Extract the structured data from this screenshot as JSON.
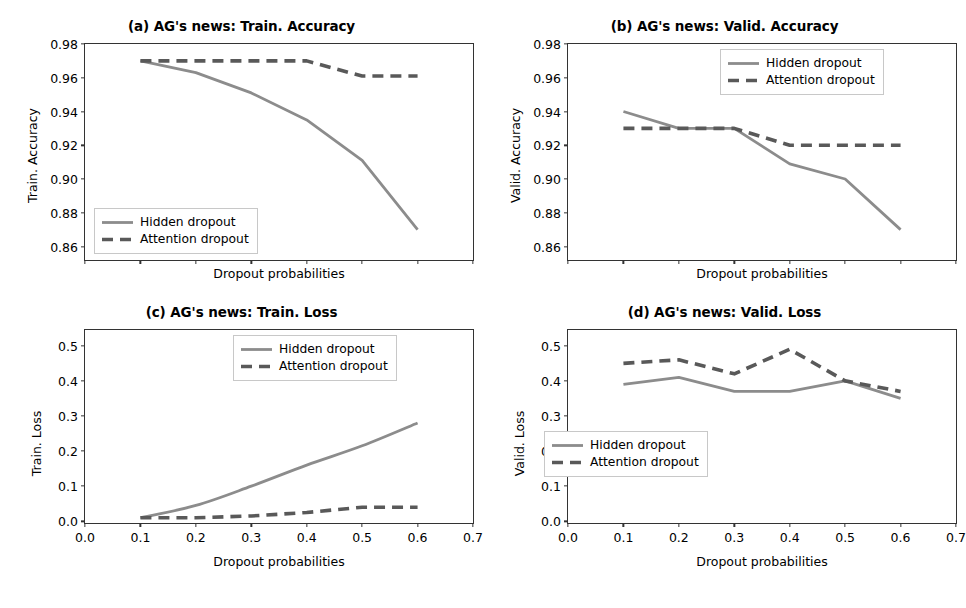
{
  "figure": {
    "width": 966,
    "height": 608,
    "background": "#ffffff",
    "series_colors": {
      "hidden": "#8c8c8c",
      "attention": "#595959"
    },
    "axis_color": "#333333"
  },
  "common": {
    "xlabel": "Dropout probabilities",
    "legend": {
      "hidden_label": "Hidden dropout",
      "attention_label": "Attention dropout"
    },
    "x_values": [
      0.1,
      0.2,
      0.3,
      0.4,
      0.5,
      0.6
    ],
    "x_tick_labels": [
      "0.0",
      "0.1",
      "0.2",
      "0.3",
      "0.4",
      "0.5",
      "0.6",
      "0.7"
    ]
  },
  "panels": {
    "a": {
      "title": "(a) AG's news: Train. Accuracy",
      "ylabel": "Train. Accuracy",
      "y_tick_labels": [
        "0.86",
        "0.88",
        "0.90",
        "0.92",
        "0.94",
        "0.96",
        "0.98"
      ]
    },
    "b": {
      "title": "(b) AG's news: Valid. Accuracy",
      "ylabel": "Valid. Accuracy",
      "y_tick_labels": [
        "0.86",
        "0.88",
        "0.90",
        "0.92",
        "0.94",
        "0.96",
        "0.98"
      ]
    },
    "c": {
      "title": "(c) AG's news: Train. Loss",
      "ylabel": "Train. Loss",
      "y_tick_labels": [
        "0.0",
        "0.1",
        "0.2",
        "0.3",
        "0.4",
        "0.5"
      ]
    },
    "d": {
      "title": "(d) AG's news: Valid. Loss",
      "ylabel": "Valid. Loss",
      "y_tick_labels": [
        "0.0",
        "0.1",
        "0.2",
        "0.3",
        "0.4",
        "0.5"
      ]
    }
  },
  "chart_data": [
    {
      "id": "a",
      "type": "line",
      "title": "(a) AG's news: Train. Accuracy",
      "xlabel": "Dropout probabilities",
      "ylabel": "Train. Accuracy",
      "x": [
        0.1,
        0.2,
        0.3,
        0.4,
        0.5,
        0.6
      ],
      "xlim": [
        0.0,
        0.7
      ],
      "ylim": [
        0.852,
        0.98
      ],
      "yticks": [
        0.86,
        0.88,
        0.9,
        0.92,
        0.94,
        0.96,
        0.98
      ],
      "xticks": [
        0.0,
        0.1,
        0.2,
        0.3,
        0.4,
        0.5,
        0.6,
        0.7
      ],
      "xticklabels_visible": false,
      "grid": false,
      "legend_position": "lower left",
      "series": [
        {
          "name": "Hidden dropout",
          "style": "solid",
          "color": "#8c8c8c",
          "values": [
            0.97,
            0.963,
            0.951,
            0.935,
            0.911,
            0.87
          ]
        },
        {
          "name": "Attention dropout",
          "style": "dashed",
          "color": "#595959",
          "values": [
            0.97,
            0.97,
            0.97,
            0.97,
            0.961,
            0.961
          ]
        }
      ]
    },
    {
      "id": "b",
      "type": "line",
      "title": "(b) AG's news: Valid. Accuracy",
      "xlabel": "Dropout probabilities",
      "ylabel": "Valid. Accuracy",
      "x": [
        0.1,
        0.2,
        0.3,
        0.4,
        0.5,
        0.6
      ],
      "xlim": [
        0.0,
        0.7
      ],
      "ylim": [
        0.852,
        0.98
      ],
      "yticks": [
        0.86,
        0.88,
        0.9,
        0.92,
        0.94,
        0.96,
        0.98
      ],
      "xticks": [
        0.0,
        0.1,
        0.2,
        0.3,
        0.4,
        0.5,
        0.6,
        0.7
      ],
      "xticklabels_visible": false,
      "grid": false,
      "legend_position": "upper right",
      "series": [
        {
          "name": "Hidden dropout",
          "style": "solid",
          "color": "#8c8c8c",
          "values": [
            0.94,
            0.93,
            0.93,
            0.909,
            0.9,
            0.87
          ]
        },
        {
          "name": "Attention dropout",
          "style": "dashed",
          "color": "#595959",
          "values": [
            0.93,
            0.93,
            0.93,
            0.92,
            0.92,
            0.92
          ]
        }
      ]
    },
    {
      "id": "c",
      "type": "line",
      "title": "(c) AG's news: Train. Loss",
      "xlabel": "Dropout probabilities",
      "ylabel": "Train. Loss",
      "x": [
        0.1,
        0.2,
        0.3,
        0.4,
        0.5,
        0.6
      ],
      "xlim": [
        0.0,
        0.7
      ],
      "ylim": [
        -0.005,
        0.545
      ],
      "yticks": [
        0.0,
        0.1,
        0.2,
        0.3,
        0.4,
        0.5
      ],
      "xticks": [
        0.0,
        0.1,
        0.2,
        0.3,
        0.4,
        0.5,
        0.6,
        0.7
      ],
      "xticklabels_visible": true,
      "grid": false,
      "legend_position": "upper right",
      "series": [
        {
          "name": "Hidden dropout",
          "style": "solid",
          "color": "#8c8c8c",
          "values": [
            0.01,
            0.045,
            0.1,
            0.16,
            0.215,
            0.28
          ]
        },
        {
          "name": "Attention dropout",
          "style": "dashed",
          "color": "#595959",
          "values": [
            0.01,
            0.01,
            0.015,
            0.025,
            0.04,
            0.04
          ]
        }
      ]
    },
    {
      "id": "d",
      "type": "line",
      "title": "(d) AG's news: Valid. Loss",
      "xlabel": "Dropout probabilities",
      "ylabel": "Valid. Loss",
      "x": [
        0.1,
        0.2,
        0.3,
        0.4,
        0.5,
        0.6
      ],
      "xlim": [
        0.0,
        0.7
      ],
      "ylim": [
        -0.005,
        0.545
      ],
      "yticks": [
        0.0,
        0.1,
        0.2,
        0.3,
        0.4,
        0.5
      ],
      "xticks": [
        0.0,
        0.1,
        0.2,
        0.3,
        0.4,
        0.5,
        0.6,
        0.7
      ],
      "xticklabels_visible": true,
      "grid": false,
      "legend_position": "lower left",
      "series": [
        {
          "name": "Hidden dropout",
          "style": "solid",
          "color": "#8c8c8c",
          "values": [
            0.39,
            0.41,
            0.37,
            0.37,
            0.4,
            0.35
          ]
        },
        {
          "name": "Attention dropout",
          "style": "dashed",
          "color": "#595959",
          "values": [
            0.45,
            0.46,
            0.42,
            0.49,
            0.4,
            0.37
          ]
        }
      ]
    }
  ]
}
